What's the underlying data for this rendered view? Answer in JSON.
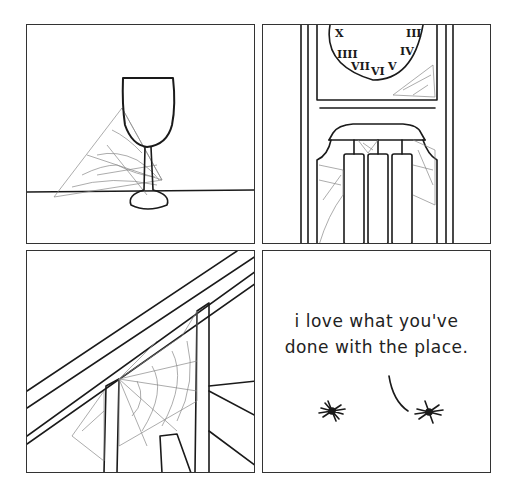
{
  "comic": {
    "panels": [
      {
        "id": 1,
        "scene": "wine glass on table with cobweb"
      },
      {
        "id": 2,
        "scene": "grandfather clock with cobwebs around pendulum weights"
      },
      {
        "id": 3,
        "scene": "staircase banister with large cobweb"
      },
      {
        "id": 4,
        "scene": "two spiders talking"
      }
    ],
    "dialogue": {
      "line1": "i love what you've",
      "line2": "done with the place."
    }
  }
}
